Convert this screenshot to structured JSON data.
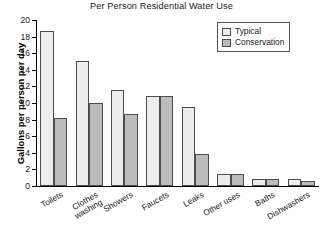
{
  "chart_data": {
    "type": "bar",
    "title": "Per Person Residential Water Use",
    "xlabel": "",
    "ylabel": "Gallons per person per day",
    "ylim": [
      0,
      20
    ],
    "ytick_step": 2,
    "yticks": [
      0,
      2,
      4,
      6,
      8,
      10,
      12,
      14,
      16,
      18,
      20
    ],
    "ytick_labels": [
      "0",
      "2",
      "4",
      "6",
      "8",
      "10",
      "12",
      "14",
      "16",
      "18",
      "20"
    ],
    "grid": false,
    "legend_position": "top-right",
    "categories": [
      "Toilets",
      "Clothes\nwashing",
      "Showers",
      "Faucets",
      "Leaks",
      "Other uses",
      "Baths",
      "Dishwashers"
    ],
    "series": [
      {
        "name": "Typical",
        "color": "#ececec",
        "values": [
          18.7,
          15.1,
          11.6,
          10.9,
          9.5,
          1.4,
          0.9,
          0.9
        ]
      },
      {
        "name": "Conservation",
        "color": "#bcbcbc",
        "values": [
          8.2,
          10.0,
          8.7,
          10.8,
          3.8,
          1.4,
          0.9,
          0.6
        ]
      }
    ]
  },
  "legend": {
    "items": [
      {
        "label": "Typical",
        "swatch": "#ececec"
      },
      {
        "label": "Conservation",
        "swatch": "#bcbcbc"
      }
    ]
  },
  "colors": {
    "typical": "#ececec",
    "conservation": "#bcbcbc",
    "bar_outline": "#4d4d4d",
    "axis": "#000000",
    "text": "#1a1a1a",
    "background": "#ffffff"
  }
}
